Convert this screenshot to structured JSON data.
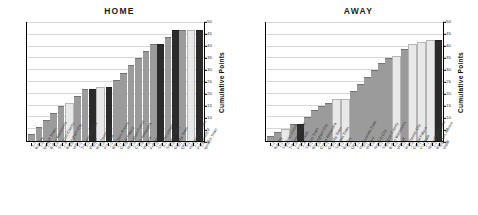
{
  "figure": {
    "axis_title": "Cumulative Points",
    "y_ticks": [
      "0",
      "5",
      "10",
      "15",
      "20",
      "25",
      "30",
      "35",
      "40",
      "45",
      "50"
    ],
    "colors": {
      "win": "#9b9b9b",
      "draw": "#e8e8e8",
      "loss": "#2b2b2b",
      "axis": "#000000",
      "grid": "#d8d8d8"
    }
  },
  "chart_data": [
    {
      "type": "bar",
      "title": "HOME",
      "xlabel": "",
      "ylabel": "Cumulative Points",
      "ylim": [
        0,
        50
      ],
      "ytick_step": 5,
      "grid": true,
      "legend": "none",
      "categories": [
        "Burnley 3-1",
        "Ipswich Town 1-0",
        "Bolton Wanderers 2-1",
        "Stockport County 4-0",
        "Birmingham City 1-0",
        "WBA 0-0",
        "Tranmere Rovers 2-2",
        "Walsall 2-1",
        "Manchester City 0-1",
        "Port Vale 2-0",
        "Blackburn Rovers 1-2",
        "Crystal Palace 2-1",
        "Nottingham Forest 3-0",
        "Crewe Alexandra 1-0",
        "Watford 2-0",
        "Fulham 1-0",
        "Sheffield United 1-2",
        "Swindon Town 0-1",
        "Grimsby Town 4-0",
        "QPR 0-1",
        "Huddersfield Town 0-1",
        "Portsmouth 1-1",
        "Ipswich Town 1-0"
      ],
      "values": [
        3,
        6,
        9,
        12,
        15,
        16,
        19,
        22,
        22,
        23,
        23,
        26,
        29,
        32,
        35,
        38,
        41,
        41,
        44,
        47,
        47,
        47,
        47
      ],
      "bar_styles": [
        "win",
        "win",
        "win",
        "win",
        "win",
        "draw",
        "win",
        "win",
        "loss",
        "draw",
        "loss",
        "win",
        "win",
        "win",
        "win",
        "win",
        "win",
        "loss",
        "win",
        "loss",
        "win",
        "draw",
        "loss"
      ]
    },
    {
      "type": "bar",
      "title": "AWAY",
      "xlabel": "",
      "ylabel": "Cumulative Points",
      "ylim": [
        0,
        50
      ],
      "ytick_step": 5,
      "grid": true,
      "legend": "none",
      "categories": [
        "Burnley 1-2",
        "Sheffield United 2-1",
        "Tranmere Rovers 2-2",
        "Portsmouth 2-0",
        "Stretton Town 2-4",
        "Birmingham City 0-1",
        "Crewe Alexandra 2-0",
        "Grimsby Town 5-2",
        "Swindon Town 2-1",
        "Burnley 1-1",
        "QPR 0-0",
        "Huddersfield Town 2-1",
        "Watford 3-1",
        "Norwich City 3-0",
        "Stockport County 3-1",
        "Bolton Wanderers 3-0",
        "Walsall 4-2",
        "Manchester City 1-1",
        "Crystal Palace 1-0",
        "Port Vale 2-2",
        "Nottingham Forest 1-1",
        "Blackburn Rovers 1-1",
        "WBA 0-6"
      ],
      "values": [
        2,
        4,
        5,
        7,
        7,
        10,
        13,
        15,
        16,
        18,
        18,
        21,
        24,
        27,
        30,
        33,
        35,
        36,
        39,
        41,
        42,
        43,
        43
      ],
      "bar_styles": [
        "win",
        "win",
        "draw",
        "win",
        "loss",
        "win",
        "win",
        "win",
        "win",
        "draw",
        "draw",
        "win",
        "win",
        "win",
        "win",
        "win",
        "win",
        "draw",
        "win",
        "draw",
        "draw",
        "draw",
        "loss"
      ]
    }
  ]
}
